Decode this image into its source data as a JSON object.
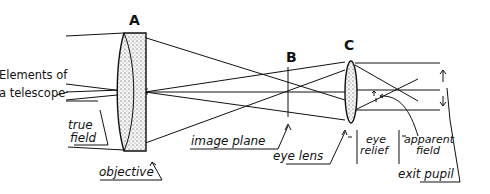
{
  "diagram": {
    "title": "Elements of a telescope",
    "title_lines": [
      "Elements of",
      "a telescope"
    ],
    "colors": {
      "ink": "#111111",
      "background": "#ffffff",
      "glass_stipple": "#e8e8e8"
    },
    "elements": {
      "A": {
        "letter": "A",
        "label": "objective"
      },
      "B": {
        "letter": "B",
        "label": "image plane"
      },
      "C": {
        "letter": "C",
        "label": "eye lens"
      }
    },
    "annotations": {
      "true_field": [
        "true",
        "field"
      ],
      "eye_relief": [
        "eye",
        "relief"
      ],
      "apparent_field": [
        "apparent",
        "field"
      ],
      "exit_pupil": "exit pupil"
    }
  }
}
